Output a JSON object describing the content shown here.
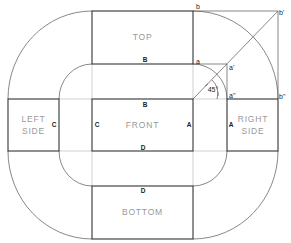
{
  "diagram": {
    "faces": {
      "top": "TOP",
      "front": "FRONT",
      "bottom": "BOTTOM",
      "left_line1": "LEFT",
      "left_line2": "SIDE",
      "right_line1": "RIGHT",
      "right_line2": "SIDE"
    },
    "edges": {
      "top_bottom_edge": "B",
      "front_top_edge": "B",
      "front_left_edge": "C",
      "left_right_edge": "C",
      "front_right_edge": "A",
      "right_left_edge": "A",
      "front_bottom_edge": "D",
      "bottom_top_edge": "D"
    },
    "points": {
      "b": "b",
      "b_prime": "b'",
      "b_double_prime": "b''",
      "a": "a",
      "a_prime": "a'",
      "a_double_prime": "a''"
    },
    "angle": "45°"
  }
}
